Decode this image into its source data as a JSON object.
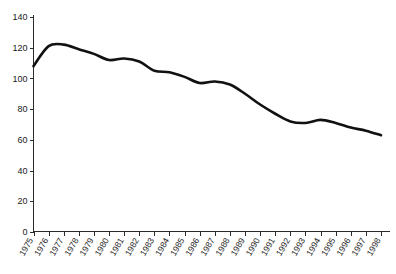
{
  "chart_data": {
    "type": "line",
    "title": "",
    "subtitle": "",
    "xlabel": "",
    "ylabel": "",
    "x": [
      1975,
      1976,
      1977,
      1978,
      1979,
      1980,
      1981,
      1982,
      1983,
      1984,
      1985,
      1986,
      1987,
      1988,
      1989,
      1990,
      1991,
      1992,
      1993,
      1994,
      1995,
      1996,
      1997,
      1998
    ],
    "categories": [
      "1975",
      "1976",
      "1977",
      "1978",
      "1979",
      "1980",
      "1981",
      "1982",
      "1983",
      "1984",
      "1985",
      "1986",
      "1987",
      "1988",
      "1989",
      "1990",
      "1991",
      "1992",
      "1993",
      "1994",
      "1995",
      "1996",
      "1997",
      "1998"
    ],
    "values": [
      108,
      121,
      122,
      119,
      116,
      112,
      113,
      111,
      105,
      104,
      101,
      97,
      98,
      96,
      90,
      83,
      77,
      72,
      71,
      73,
      71,
      68,
      66,
      63
    ],
    "series": [
      {
        "name": "",
        "values": [
          108,
          121,
          122,
          119,
          116,
          112,
          113,
          111,
          105,
          104,
          101,
          97,
          98,
          96,
          90,
          83,
          77,
          72,
          71,
          73,
          71,
          68,
          66,
          63
        ]
      }
    ],
    "ylim": [
      0,
      140
    ],
    "yticks": [
      0,
      20,
      40,
      60,
      80,
      100,
      120,
      140
    ],
    "ytick_labels": [
      "0",
      "20",
      "40",
      "60",
      "80",
      "100",
      "120",
      "140"
    ],
    "xtick_labels": [
      "1975",
      "1976",
      "1977",
      "1978",
      "1979",
      "1980",
      "1981",
      "1982",
      "1983",
      "1984",
      "1985",
      "1986",
      "1987",
      "1988",
      "1989",
      "1990",
      "1991",
      "1992",
      "1993",
      "1994",
      "1995",
      "1996",
      "1997",
      "1998"
    ],
    "xtick_rotation": -60,
    "grid": false,
    "legend": false,
    "legend_position": "none",
    "line_color": "#111111",
    "axis_color": "#2b2b2b",
    "background_color": "#ffffff"
  }
}
